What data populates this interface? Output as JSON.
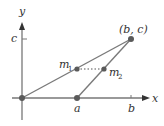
{
  "diagram": {
    "axes": {
      "x_label": "x",
      "y_label": "y",
      "x_ticks": [
        "a",
        "b"
      ],
      "y_ticks": [
        "c"
      ]
    },
    "points": {
      "origin": {
        "label": ""
      },
      "a": {
        "label": "a"
      },
      "bc": {
        "label": "(b, c)"
      },
      "m1": {
        "label": "m",
        "sub": "1"
      },
      "m2": {
        "label": "m",
        "sub": "2"
      }
    },
    "colors": {
      "line": "#7a7a7a",
      "point": "#5a5a5a",
      "axis": "#777777",
      "text": "#333333"
    }
  }
}
